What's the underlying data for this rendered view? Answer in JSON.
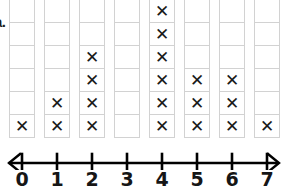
{
  "item_label": "a.",
  "colors": {
    "mark": "#1a1a1a",
    "cell_border": "#d2d2d2",
    "axis": "#000000",
    "background": "#ffffff"
  },
  "mark_glyph": "✕",
  "grid": {
    "rows": 6,
    "columns": 8
  },
  "axis": {
    "tick_labels": [
      "0",
      "1",
      "2",
      "3",
      "4",
      "5",
      "6",
      "7"
    ],
    "left_arrow": true,
    "right_arrow": true
  },
  "chart_data": {
    "type": "bar",
    "plot_style": "line-plot-dot-plot",
    "title": "",
    "subtitle": "",
    "xlabel": "",
    "ylabel": "",
    "categories": [
      "0",
      "1",
      "2",
      "3",
      "4",
      "5",
      "6",
      "7"
    ],
    "values": [
      1,
      2,
      4,
      0,
      6,
      3,
      3,
      1
    ],
    "x": [
      0,
      1,
      2,
      3,
      4,
      5,
      6,
      7
    ],
    "counts": [
      1,
      2,
      4,
      0,
      6,
      3,
      3,
      1
    ],
    "total": 20,
    "xlim": [
      0,
      7
    ],
    "ylim": [
      0,
      6
    ],
    "grid": true,
    "legend": "none",
    "annotations": [
      "a."
    ],
    "tick_labels_x": [
      "0",
      "1",
      "2",
      "3",
      "4",
      "5",
      "6",
      "7"
    ],
    "mark_symbol": "X",
    "marks_per_column": [
      {
        "value": 0,
        "count": 1
      },
      {
        "value": 1,
        "count": 2
      },
      {
        "value": 2,
        "count": 4
      },
      {
        "value": 3,
        "count": 0
      },
      {
        "value": 4,
        "count": 6
      },
      {
        "value": 5,
        "count": 3
      },
      {
        "value": 6,
        "count": 3
      },
      {
        "value": 7,
        "count": 1
      }
    ]
  }
}
